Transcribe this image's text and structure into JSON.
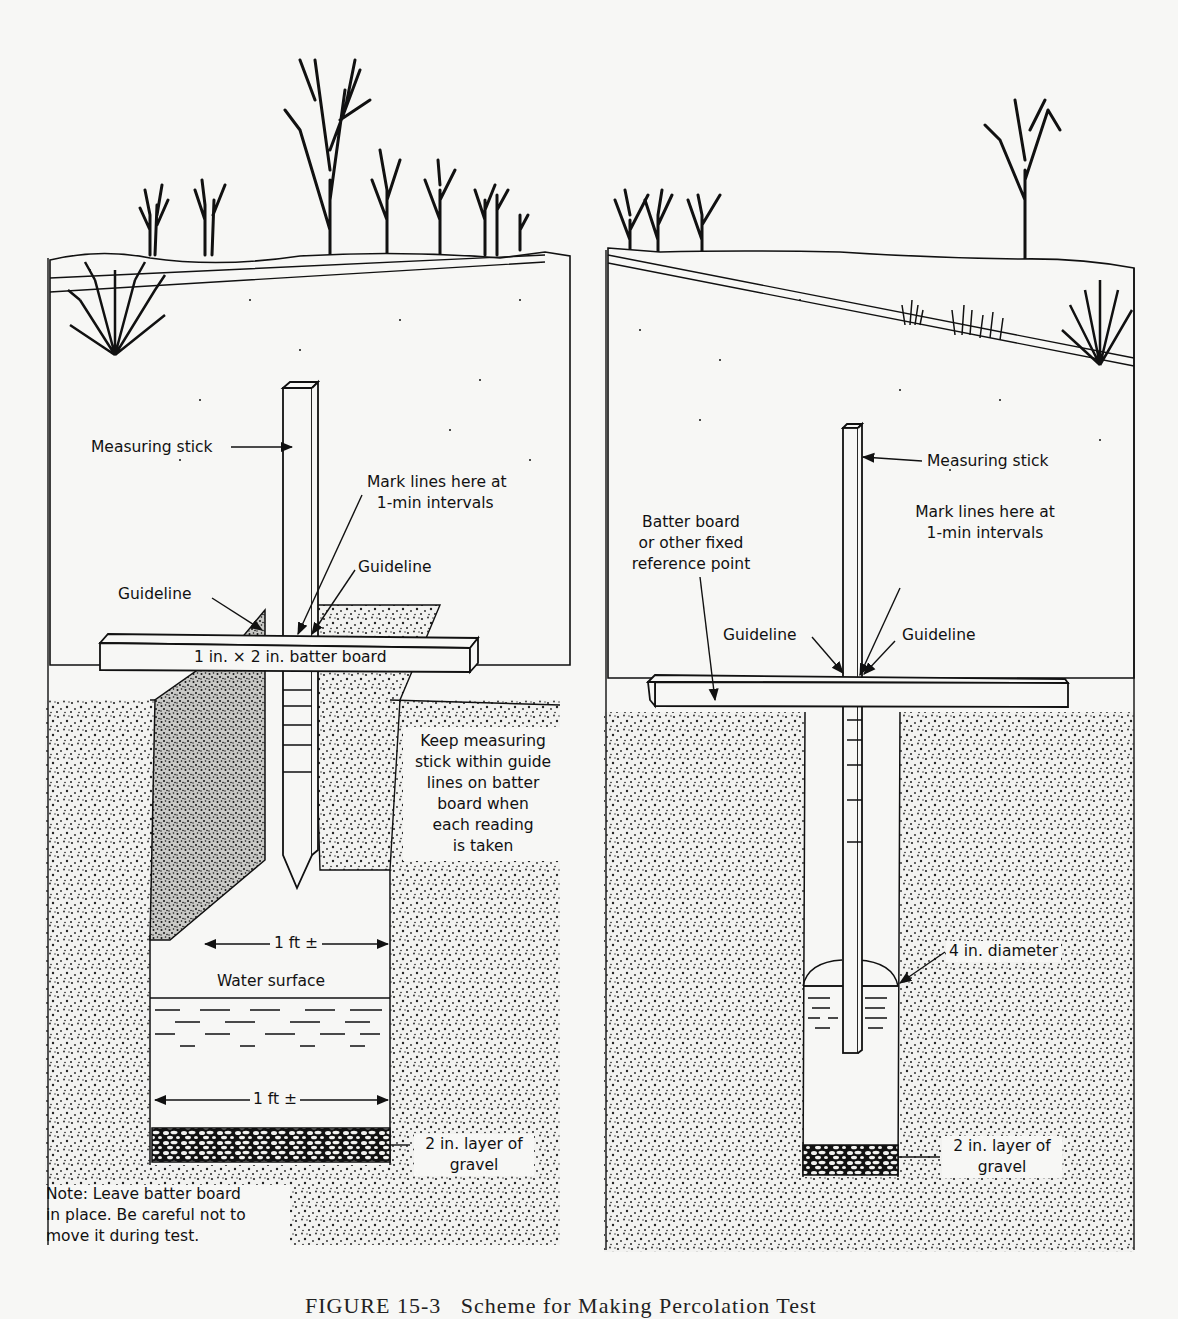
{
  "figure": {
    "caption": "FIGURE 15-3   Scheme for Making Percolation Test",
    "colors": {
      "ink": "#111111",
      "paper": "#f7f7f5",
      "soil": "#8a8a8a"
    }
  },
  "left_panel": {
    "labels": {
      "measuring_stick": "Measuring stick",
      "mark_lines": "Mark lines here at\n  1-min intervals",
      "guideline_right": "Guideline",
      "guideline_left": "Guideline",
      "batter_board": "1 in. × 2 in. batter board",
      "keep_stick": "Keep measuring\nstick within guide\nlines on batter\nboard when\neach reading\nis taken",
      "width_top": "1 ft ±",
      "water_surface": "Water surface",
      "width_bottom": "1 ft ±",
      "gravel": "2 in. layer of\ngravel",
      "note": "Note: Leave batter board\nin place. Be careful not to\nmove it during test."
    },
    "stick_graduations": 5
  },
  "right_panel": {
    "labels": {
      "measuring_stick": "Measuring stick",
      "batter_board": "Batter board\nor other fixed\nreference point",
      "mark_lines": "Mark lines here at\n1-min intervals",
      "guideline_left": "Guideline",
      "guideline_right": "Guideline",
      "diameter": "4 in. diameter",
      "gravel": "2 in. layer of\ngravel"
    },
    "stick_graduations": 5
  }
}
